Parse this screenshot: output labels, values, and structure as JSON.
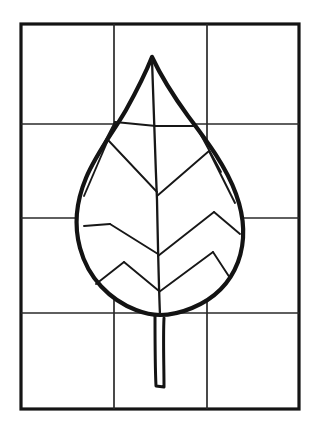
{
  "document": {
    "kind": "line-art-illustration",
    "subject": "leaf-on-drawing-grid",
    "title": "Leaf outline on a 3-by-4 drawing grid",
    "width": 315,
    "height": 439,
    "background_color": "#ffffff",
    "ink_color": "#111111"
  },
  "grid": {
    "name": "drawing-grid",
    "columns": 3,
    "rows": 4,
    "frame": {
      "left": 21,
      "top": 24,
      "right": 299,
      "bottom": 409
    },
    "frame_stroke_color": "#141414",
    "frame_stroke_width": 3.2,
    "inner_stroke_color": "#2a2a2a",
    "inner_stroke_width": 1.7,
    "vertical_line_x": [
      114,
      207
    ],
    "horizontal_line_y": [
      124,
      218,
      313
    ]
  },
  "leaf": {
    "name": "leaf-drawing",
    "outline_stroke_color": "#131313",
    "outline_stroke_width": 4.2,
    "vein_stroke_color": "#171717",
    "vein_stroke_width": 1.9,
    "stem_stroke_width": 3.0,
    "tip_point": {
      "x": 152,
      "y": 57
    },
    "base_point": {
      "x": 160,
      "y": 315
    },
    "widest_left_x": 80,
    "widest_right_x": 232,
    "widest_y": 218,
    "stem_bottom_y": 390,
    "outline_path": "M152,57 C146,72 136,92 126,110 C112,134 96,154 86,178 C76,202 74,226 80,248 C88,278 110,300 136,310 C146,314 154,315 160,315 C168,315 180,313 192,308 C214,299 230,283 238,262 C246,240 244,216 236,194 C226,166 206,140 188,116 C172,94 160,74 152,57 Z",
    "midrib_path": "M152,60 C153,96 155,150 157,200 C158,250 159,292 160,315",
    "veins_left": [
      "M156,126 L115,122",
      "M115,122 L86,178",
      "M157,192 L108,140",
      "M108,140 L84,196",
      "M158,254 L110,224",
      "M110,224 L84,226",
      "M159,291 L124,262",
      "M124,262 L96,284"
    ],
    "veins_right": [
      "M156,126 L196,126",
      "M196,126 L221,172",
      "M157,196 L209,151",
      "M209,151 L235,203",
      "M158,256 L214,212",
      "M214,212 L240,234",
      "M159,292 L213,252",
      "M213,252 L230,278"
    ],
    "stem_path": "M155,316 C155,336 155,366 156,386 L164,387 C164,366 163,338 164,318"
  }
}
